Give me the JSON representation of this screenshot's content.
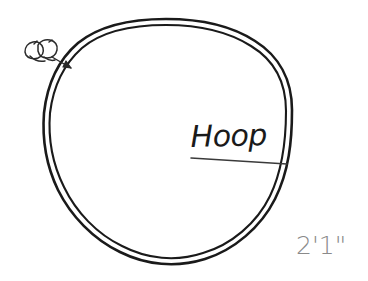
{
  "drawing": {
    "type": "hand-drawn-technical-sketch",
    "subject": "Hoop",
    "background_color": "#ffffff",
    "ink_color": "#1a1a1a",
    "dimension_color": "#8a8a8a"
  },
  "labels": {
    "hoop": "Hoop",
    "dimension": "2'1\""
  },
  "annotations": {
    "leader_line_name": "hoop-leader-line",
    "callout_arrow_name": "detail-callout-arrow",
    "detail_sketch_name": "clip-detail-sketch"
  },
  "shapes": {
    "hoop_outer_name": "hoop-outer-ring",
    "hoop_inner_name": "hoop-inner-ring"
  }
}
